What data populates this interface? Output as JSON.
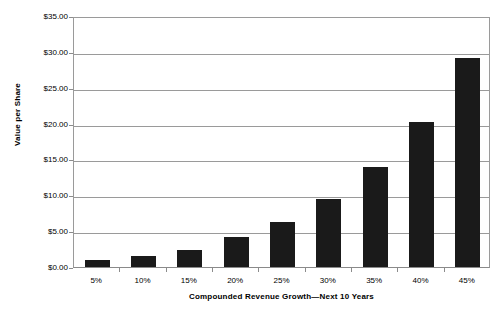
{
  "chart_data": {
    "type": "bar",
    "title": "",
    "subtitle": "",
    "xlabel": "Compounded Revenue Growth—Next 10 Years",
    "ylabel": "Value per Share",
    "categories": [
      "5%",
      "10%",
      "15%",
      "20%",
      "25%",
      "30%",
      "35%",
      "40%",
      "45%"
    ],
    "values": [
      1.0,
      1.5,
      2.4,
      4.2,
      6.3,
      9.5,
      14.0,
      20.2,
      29.2
    ],
    "ylim": [
      0,
      35
    ],
    "ytick_values": [
      0,
      5,
      10,
      15,
      20,
      25,
      30,
      35
    ],
    "ytick_labels": [
      "$0.00",
      "$5.00",
      "$10.00",
      "$15.00",
      "$20.00",
      "$25.00",
      "$30.00",
      "$35.00"
    ],
    "grid": true,
    "grid_axis": "y",
    "legend": false,
    "legend_position": "none",
    "bar_color": "#1a1a1a",
    "axis_color": "#9a9a9a",
    "background_color": "#ffffff"
  }
}
